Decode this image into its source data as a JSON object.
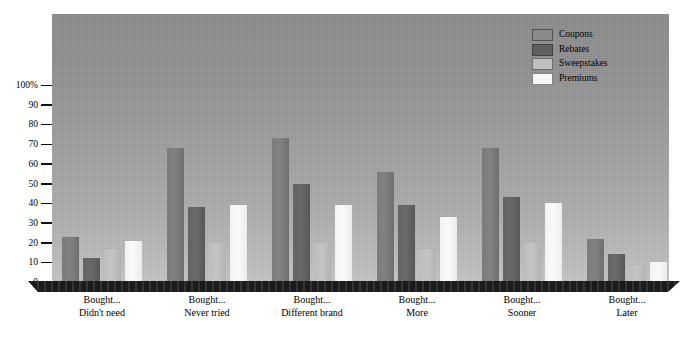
{
  "chart_data": {
    "type": "bar",
    "title": "",
    "subtitle": "",
    "xlabel": "",
    "ylabel": "",
    "ylim": [
      0,
      100
    ],
    "yticks": [
      "0",
      "10",
      "20",
      "30",
      "40",
      "50",
      "60",
      "70",
      "80",
      "90",
      "100%"
    ],
    "ytick_values": [
      0,
      10,
      20,
      30,
      40,
      50,
      60,
      70,
      80,
      90,
      100
    ],
    "grid": false,
    "legend_position": "top-right",
    "categories": [
      "Bought...\nDidn't need",
      "Bought...\nNever tried",
      "Bought...\nDifferent brand",
      "Bought...\nMore",
      "Bought...\nSooner",
      "Bought...\nLater"
    ],
    "category_lines": [
      [
        "Bought...",
        "Didn't need"
      ],
      [
        "Bought...",
        "Never tried"
      ],
      [
        "Bought...",
        "Different brand"
      ],
      [
        "Bought...",
        "More"
      ],
      [
        "Bought...",
        "Sooner"
      ],
      [
        "Bought...",
        "Later"
      ]
    ],
    "series": [
      {
        "name": "Coupons",
        "color": "#7d7d7d",
        "values": [
          23,
          68,
          73,
          56,
          68,
          22
        ]
      },
      {
        "name": "Rebates",
        "color": "#606060",
        "values": [
          12,
          38,
          50,
          39,
          43,
          14
        ]
      },
      {
        "name": "Sweepstakes",
        "color": "#bfbfbf",
        "values": [
          17,
          20,
          20,
          17,
          20,
          8
        ]
      },
      {
        "name": "Premiums",
        "color": "#f5f5f5",
        "values": [
          21,
          39,
          39,
          33,
          40,
          10
        ]
      }
    ]
  },
  "legend": {
    "items": [
      {
        "label": "Coupons"
      },
      {
        "label": "Rebates"
      },
      {
        "label": "Sweepstakes"
      },
      {
        "label": "Premiums"
      }
    ]
  }
}
